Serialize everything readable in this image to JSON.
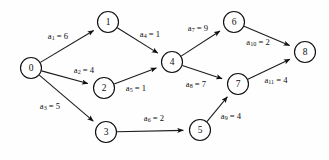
{
  "figure": {
    "background_color": "#fefefe",
    "stroke_color": "#1a1a1a",
    "node_fill_color": "#ffffff",
    "width": 329,
    "height": 160
  },
  "graph": {
    "type": "directed-weighted-graph",
    "node_radius": 10.5,
    "nodes": [
      {
        "id": "n0",
        "label": "0",
        "x": 31,
        "y": 68
      },
      {
        "id": "n1",
        "label": "1",
        "x": 108,
        "y": 22
      },
      {
        "id": "n2",
        "label": "2",
        "x": 104,
        "y": 88
      },
      {
        "id": "n3",
        "label": "3",
        "x": 106,
        "y": 132
      },
      {
        "id": "n4",
        "label": "4",
        "x": 172,
        "y": 62
      },
      {
        "id": "n5",
        "label": "5",
        "x": 200,
        "y": 130
      },
      {
        "id": "n6",
        "label": "6",
        "x": 234,
        "y": 22
      },
      {
        "id": "n7",
        "label": "7",
        "x": 238,
        "y": 84
      },
      {
        "id": "n8",
        "label": "8",
        "x": 305,
        "y": 52
      }
    ],
    "edges": [
      {
        "id": "e1",
        "name": "a1",
        "from": "n0",
        "to": "n1",
        "weight": 6,
        "label_prefix": "a",
        "label_sub": "1",
        "label_value": "= 6",
        "label_x": 58,
        "label_y": 37
      },
      {
        "id": "e2",
        "name": "a2",
        "from": "n0",
        "to": "n2",
        "weight": 4,
        "label_prefix": "a",
        "label_sub": "2",
        "label_value": "= 4",
        "label_x": 84,
        "label_y": 71
      },
      {
        "id": "e3",
        "name": "a3",
        "from": "n0",
        "to": "n3",
        "weight": 5,
        "label_prefix": "a",
        "label_sub": "3",
        "label_value": "= 5",
        "label_x": 50,
        "label_y": 107
      },
      {
        "id": "e4",
        "name": "a4",
        "from": "n1",
        "to": "n4",
        "weight": 1,
        "label_prefix": "a",
        "label_sub": "4",
        "label_value": "= 1",
        "label_x": 150,
        "label_y": 35
      },
      {
        "id": "e5",
        "name": "a5",
        "from": "n2",
        "to": "n4",
        "weight": 1,
        "label_prefix": "a",
        "label_sub": "5",
        "label_value": "= 1",
        "label_x": 136,
        "label_y": 89
      },
      {
        "id": "e6",
        "name": "a6",
        "from": "n3",
        "to": "n5",
        "weight": 2,
        "label_prefix": "a",
        "label_sub": "6",
        "label_value": "= 2",
        "label_x": 154,
        "label_y": 119
      },
      {
        "id": "e7",
        "name": "a7",
        "from": "n4",
        "to": "n6",
        "weight": 9,
        "label_prefix": "a",
        "label_sub": "7",
        "label_value": "= 9",
        "label_x": 198,
        "label_y": 29
      },
      {
        "id": "e8",
        "name": "a8",
        "from": "n4",
        "to": "n7",
        "weight": 7,
        "label_prefix": "a",
        "label_sub": "8",
        "label_value": "= 7",
        "label_x": 196,
        "label_y": 85
      },
      {
        "id": "e9",
        "name": "a9",
        "from": "n5",
        "to": "n7",
        "weight": 4,
        "label_prefix": "a",
        "label_sub": "9",
        "label_value": "= 4",
        "label_x": 231,
        "label_y": 117
      },
      {
        "id": "e10",
        "name": "a10",
        "from": "n6",
        "to": "n8",
        "weight": 2,
        "label_prefix": "a",
        "label_sub": "10",
        "label_value": "= 2",
        "label_x": 258,
        "label_y": 43
      },
      {
        "id": "e11",
        "name": "a11",
        "from": "n7",
        "to": "n8",
        "weight": 4,
        "label_prefix": "a",
        "label_sub": "11",
        "label_value": "= 4",
        "label_x": 276,
        "label_y": 81
      }
    ]
  }
}
